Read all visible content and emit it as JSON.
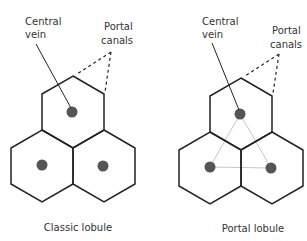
{
  "diagrams": [
    {
      "caption": "Classic lobule",
      "labels": {
        "central_vein_line1": "Central",
        "central_vein_line2": "vein",
        "portal_canals_line1": "Portal",
        "portal_canals_line2": "canals"
      },
      "show_portal_triangle": false
    },
    {
      "caption": "Portal lobule",
      "labels": {
        "central_vein_line1": "Central",
        "central_vein_line2": "vein",
        "portal_canals_line1": "Portal",
        "portal_canals_line2": "canals"
      },
      "show_portal_triangle": true
    }
  ],
  "colors": {
    "outline": "#222222",
    "central_vein_dot": "#555555",
    "portal_triangle": "#c8c8c8",
    "text": "#333333"
  }
}
